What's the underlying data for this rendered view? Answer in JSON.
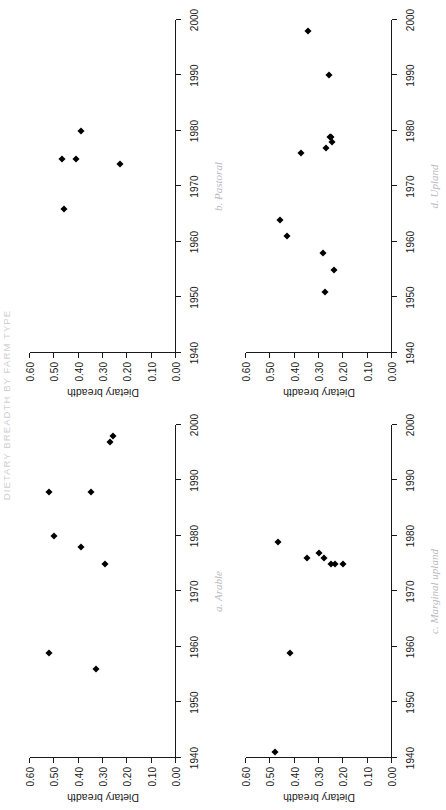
{
  "figure": {
    "running_head": "DIETARY BREADTH BY FARM TYPE",
    "axis_titles": {
      "y": "Dietary breadth",
      "x": ""
    },
    "x_ticks": [
      "1940",
      "1950",
      "1960",
      "1970",
      "1980",
      "1990",
      "2000"
    ],
    "y_ticks": [
      "0.00",
      "0.10",
      "0.20",
      "0.30",
      "0.40",
      "0.50",
      "0.60"
    ],
    "x_range": [
      1940,
      2000
    ],
    "y_range": [
      0.0,
      0.6
    ]
  },
  "chart_data": [
    {
      "type": "scatter",
      "title": "a. Arable",
      "xlabel": "",
      "ylabel": "Dietary breadth",
      "xlim": [
        1940,
        2000
      ],
      "ylim": [
        0.0,
        0.6
      ],
      "xticks": [
        1940,
        1950,
        1960,
        1970,
        1980,
        1990,
        2000
      ],
      "yticks": [
        0.0,
        0.1,
        0.2,
        0.3,
        0.4,
        0.5,
        0.6
      ],
      "grid": false,
      "legend": "none",
      "marker": "filled-diamond",
      "points": [
        {
          "x": 1956,
          "y": 0.33
        },
        {
          "x": 1959,
          "y": 0.52
        },
        {
          "x": 1975,
          "y": 0.29
        },
        {
          "x": 1978,
          "y": 0.39
        },
        {
          "x": 1980,
          "y": 0.5
        },
        {
          "x": 1988,
          "y": 0.35
        },
        {
          "x": 1988,
          "y": 0.52
        },
        {
          "x": 1997,
          "y": 0.27
        },
        {
          "x": 1998,
          "y": 0.26
        }
      ]
    },
    {
      "type": "scatter",
      "title": "b. Pastoral",
      "xlabel": "",
      "ylabel": "Dietary breadth",
      "xlim": [
        1940,
        2000
      ],
      "ylim": [
        0.0,
        0.6
      ],
      "xticks": [
        1940,
        1950,
        1960,
        1970,
        1980,
        1990,
        2000
      ],
      "yticks": [
        0.0,
        0.1,
        0.2,
        0.3,
        0.4,
        0.5,
        0.6
      ],
      "grid": false,
      "legend": "none",
      "marker": "filled-diamond",
      "points": [
        {
          "x": 1966,
          "y": 0.46
        },
        {
          "x": 1974,
          "y": 0.23
        },
        {
          "x": 1975,
          "y": 0.41
        },
        {
          "x": 1975,
          "y": 0.47
        },
        {
          "x": 1980,
          "y": 0.39
        }
      ]
    },
    {
      "type": "scatter",
      "title": "c. Marginal upland",
      "xlabel": "",
      "ylabel": "Dietary breadth",
      "xlim": [
        1940,
        2000
      ],
      "ylim": [
        0.0,
        0.6
      ],
      "xticks": [
        1940,
        1950,
        1960,
        1970,
        1980,
        1990,
        2000
      ],
      "yticks": [
        0.0,
        0.1,
        0.2,
        0.3,
        0.4,
        0.5,
        0.6
      ],
      "grid": false,
      "legend": "none",
      "marker": "filled-diamond",
      "points": [
        {
          "x": 1941,
          "y": 0.48
        },
        {
          "x": 1959,
          "y": 0.42
        },
        {
          "x": 1975,
          "y": 0.235
        },
        {
          "x": 1975,
          "y": 0.25
        },
        {
          "x": 1975,
          "y": 0.2
        },
        {
          "x": 1976,
          "y": 0.35
        },
        {
          "x": 1976,
          "y": 0.28
        },
        {
          "x": 1977,
          "y": 0.3
        },
        {
          "x": 1979,
          "y": 0.47
        }
      ]
    },
    {
      "type": "scatter",
      "title": "d. Upland",
      "xlabel": "",
      "ylabel": "Dietary breadth",
      "xlim": [
        1940,
        2000
      ],
      "ylim": [
        0.0,
        0.6
      ],
      "xticks": [
        1940,
        1950,
        1960,
        1970,
        1980,
        1990,
        2000
      ],
      "yticks": [
        0.0,
        0.1,
        0.2,
        0.3,
        0.4,
        0.5,
        0.6
      ],
      "grid": false,
      "legend": "none",
      "marker": "filled-diamond",
      "points": [
        {
          "x": 1951,
          "y": 0.275
        },
        {
          "x": 1955,
          "y": 0.24
        },
        {
          "x": 1958,
          "y": 0.285
        },
        {
          "x": 1961,
          "y": 0.43
        },
        {
          "x": 1964,
          "y": 0.46
        },
        {
          "x": 1976,
          "y": 0.375
        },
        {
          "x": 1977,
          "y": 0.27
        },
        {
          "x": 1978,
          "y": 0.245
        },
        {
          "x": 1979,
          "y": 0.255
        },
        {
          "x": 1979,
          "y": 0.25
        },
        {
          "x": 1990,
          "y": 0.26
        },
        {
          "x": 1998,
          "y": 0.345
        }
      ]
    }
  ]
}
